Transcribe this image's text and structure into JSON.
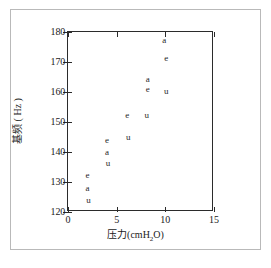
{
  "chart_data": {
    "type": "scatter",
    "title": "",
    "xlabel": "压力 (cmH2O)",
    "xlabel_main": "压力",
    "xlabel_unit_pre": "(cmH",
    "xlabel_unit_sub": "2",
    "xlabel_unit_post": "O)",
    "ylabel": "基频 ( Hz )",
    "xlim": [
      0,
      15
    ],
    "ylim": [
      120,
      180
    ],
    "xticks": [
      0,
      5,
      10,
      15
    ],
    "yticks": [
      120,
      130,
      140,
      150,
      160,
      170,
      180
    ],
    "xticklabels": [
      "0",
      "5",
      "10",
      "15"
    ],
    "yticklabels": [
      "120",
      "130",
      "140",
      "150",
      "160",
      "170",
      "180"
    ],
    "grid": false,
    "legend": "none",
    "marker_style": "text-glyph",
    "series": [
      {
        "name": "e",
        "marker": "e",
        "x": [
          2.0,
          4.0,
          6.1,
          8.2,
          10.1
        ],
        "y": [
          132.5,
          144.0,
          152.5,
          161.0,
          171.5
        ]
      },
      {
        "name": "a",
        "marker": "a",
        "x": [
          2.0,
          4.0,
          8.2,
          9.9
        ],
        "y": [
          128.0,
          140.0,
          164.5,
          177.5
        ]
      },
      {
        "name": "u",
        "marker": "u",
        "x": [
          2.1,
          4.1,
          6.2,
          8.1,
          10.1
        ],
        "y": [
          124.0,
          136.5,
          145.0,
          152.5,
          160.5
        ]
      }
    ],
    "points": [
      {
        "label": "e",
        "x": 2.0,
        "y": 132.5
      },
      {
        "label": "a",
        "x": 2.0,
        "y": 128.0
      },
      {
        "label": "u",
        "x": 2.1,
        "y": 124.0
      },
      {
        "label": "e",
        "x": 4.0,
        "y": 144.0
      },
      {
        "label": "a",
        "x": 4.0,
        "y": 140.0
      },
      {
        "label": "u",
        "x": 4.1,
        "y": 136.5
      },
      {
        "label": "e",
        "x": 6.1,
        "y": 152.5
      },
      {
        "label": "u",
        "x": 6.2,
        "y": 145.0
      },
      {
        "label": "a",
        "x": 8.2,
        "y": 164.5
      },
      {
        "label": "e",
        "x": 8.2,
        "y": 161.0
      },
      {
        "label": "u",
        "x": 8.1,
        "y": 152.5
      },
      {
        "label": "a",
        "x": 9.9,
        "y": 177.5
      },
      {
        "label": "e",
        "x": 10.1,
        "y": 171.5
      },
      {
        "label": "u",
        "x": 10.1,
        "y": 160.5
      }
    ],
    "colors": {
      "axis": "#2b2b2b",
      "marker": "#1f1f1f",
      "background": "#ffffff",
      "figure_border": "#b9b9b9"
    }
  }
}
